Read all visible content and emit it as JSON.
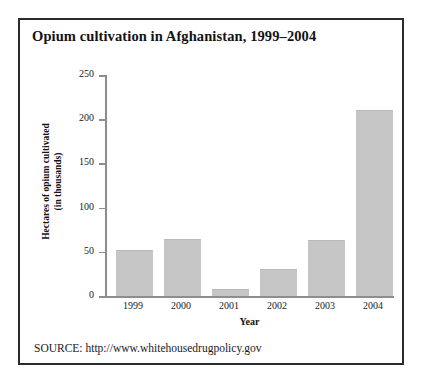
{
  "figure": {
    "title": "Opium cultivation in Afghanistan, 1999–2004",
    "source": "SOURCE: http://www.whitehousedrugpolicy.gov",
    "frame_color": "#2b2b2b",
    "background": "#ffffff"
  },
  "chart_data": {
    "type": "bar",
    "title": "Opium cultivation in Afghanistan, 1999–2004",
    "categories": [
      "1999",
      "2000",
      "2001",
      "2002",
      "2003",
      "2004"
    ],
    "values": [
      52,
      65,
      8,
      31,
      63,
      210
    ],
    "xlabel": "Year",
    "ylabel": "Hectares of opium cultivated (in thousands)",
    "ylabel_line1": "Hectares of opium cultivated",
    "ylabel_line2": "(in thousands)",
    "ylim": [
      0,
      250
    ],
    "yticks": [
      0,
      50,
      100,
      150,
      200,
      250
    ],
    "ytick_labels": [
      "0",
      "50",
      "100",
      "150",
      "200",
      "250"
    ],
    "grid": false,
    "legend": false,
    "bar_color": "#c6c6c6",
    "axis_color": "#8d8d8d"
  }
}
